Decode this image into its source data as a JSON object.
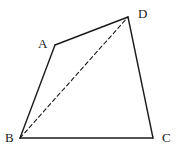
{
  "diagram": {
    "type": "quadrilateral",
    "vertices": {
      "A": {
        "label": "A",
        "x": 55,
        "y": 45,
        "label_x": 38,
        "label_y": 48
      },
      "B": {
        "label": "B",
        "x": 20,
        "y": 138,
        "label_x": 5,
        "label_y": 142
      },
      "C": {
        "label": "C",
        "x": 153,
        "y": 138,
        "label_x": 162,
        "label_y": 142
      },
      "D": {
        "label": "D",
        "x": 128,
        "y": 17,
        "label_x": 138,
        "label_y": 18
      }
    },
    "edges": [
      {
        "from": "A",
        "to": "D",
        "style": "solid"
      },
      {
        "from": "D",
        "to": "C",
        "style": "solid"
      },
      {
        "from": "C",
        "to": "B",
        "style": "solid"
      },
      {
        "from": "B",
        "to": "A",
        "style": "solid"
      },
      {
        "from": "B",
        "to": "D",
        "style": "dashed"
      }
    ],
    "stroke_color": "#1a1a1a",
    "background_color": "#ffffff"
  }
}
